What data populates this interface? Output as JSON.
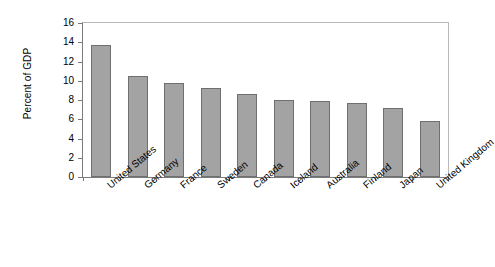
{
  "chart_data": {
    "type": "bar",
    "title": "",
    "xlabel": "",
    "ylabel": "Percent of GDP",
    "ylim": [
      0,
      16
    ],
    "ytick_step": 2,
    "yticks": [
      16,
      14,
      12,
      10,
      8,
      6,
      4,
      2,
      0
    ],
    "grid": false,
    "legend": false,
    "bar_color": "#a3a3a3",
    "bar_edge_color": "#6f6f6f",
    "categories": [
      "United States",
      "Germany",
      "France",
      "Sweden",
      "Canada",
      "Iceland",
      "Australia",
      "Finland",
      "Japan",
      "United Kingdom"
    ],
    "values": [
      13.75,
      10.5,
      9.8,
      9.2,
      8.6,
      8.0,
      7.9,
      7.65,
      7.2,
      5.85
    ]
  }
}
